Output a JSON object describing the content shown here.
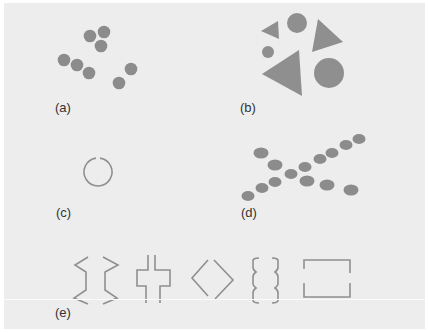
{
  "figure": {
    "background": "#ededed",
    "shape_color": "#8a8a8a",
    "panels": [
      {
        "id": "a",
        "label": "(a)",
        "description": "Eight dots grouped by proximity"
      },
      {
        "id": "b",
        "label": "(b)",
        "description": "Circles and triangles grouped by similarity"
      },
      {
        "id": "c",
        "label": "(c)",
        "description": "Nearly closed circle (closure)"
      },
      {
        "id": "d",
        "label": "(d)",
        "description": "Dots forming two crossing lines (continuity)"
      },
      {
        "id": "e",
        "label": "(e)",
        "description": "Bracket shapes forming implied closed figures"
      }
    ]
  }
}
